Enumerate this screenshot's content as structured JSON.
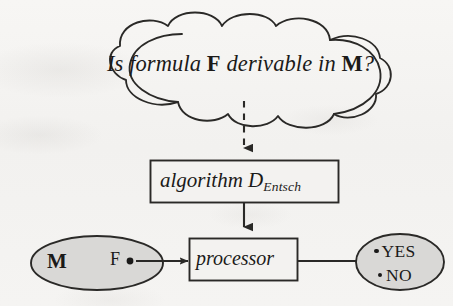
{
  "diagram": {
    "nodes": {
      "cloud": {
        "shape": "cloud",
        "text_full": "Is formula F derivable in M?",
        "text_part_1": "Is formula ",
        "text_upright_1": "F",
        "text_part_2": " derivable in ",
        "text_upright_2": "M",
        "text_part_3": "?"
      },
      "algorithm_box": {
        "shape": "rectangle",
        "text_full": "algorithm D_Entsch",
        "label": "algorithm D",
        "subscript": "Entsch"
      },
      "processor_box": {
        "shape": "rectangle",
        "label": "processor"
      },
      "input_ellipse": {
        "shape": "ellipse",
        "fill": "#d9d8d6",
        "label_m": "M",
        "label_f": "F",
        "has_input_dot": true
      },
      "output_ellipse": {
        "shape": "ellipse",
        "fill": "#d9d8d6",
        "option_yes": "YES",
        "option_no": "NO"
      }
    },
    "edges": [
      {
        "from": "cloud",
        "to": "algorithm_box",
        "style": "dashed",
        "arrowhead": "solid-triangle"
      },
      {
        "from": "algorithm_box",
        "to": "processor_box",
        "style": "solid",
        "arrowhead": "solid-triangle"
      },
      {
        "from": "input_ellipse",
        "to": "processor_box",
        "style": "solid",
        "arrowhead": "solid-triangle"
      },
      {
        "from": "processor_box",
        "to": "output_ellipse",
        "style": "solid",
        "arrowhead": "solid-triangle"
      }
    ],
    "colors": {
      "ink": "#1b1a19",
      "stroke": "#2a2927",
      "ellipse_fill": "#d9d8d6",
      "box_fill": "#f3f2f0",
      "paper": "#f4f3f1"
    }
  }
}
